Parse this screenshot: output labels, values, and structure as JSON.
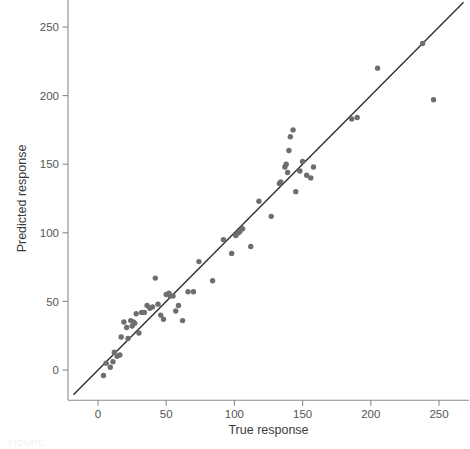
{
  "figure": {
    "caption_fragment": "FIGURE",
    "background_color": "#ffffff"
  },
  "chart_data": {
    "type": "scatter",
    "title": "",
    "xlabel": "True response",
    "ylabel": "Predicted response",
    "xlim": [
      -22,
      272
    ],
    "ylim": [
      -22,
      272
    ],
    "xticks": [
      0,
      50,
      100,
      150,
      200,
      250
    ],
    "yticks": [
      0,
      50,
      100,
      150,
      200,
      250
    ],
    "xtick_labels": [
      "0",
      "50",
      "100",
      "150",
      "200",
      "250"
    ],
    "ytick_labels": [
      "0",
      "50",
      "100",
      "150",
      "200",
      "250"
    ],
    "grid": false,
    "legend": "none",
    "point_color": "#6e6e6e",
    "point_size": 5,
    "reference_line": {
      "label": "y = x identity line",
      "color": "#2b2b2b",
      "x": [
        -18,
        268
      ],
      "y": [
        -18,
        268
      ]
    },
    "points": [
      {
        "x": 4,
        "y": -4
      },
      {
        "x": 6,
        "y": 5
      },
      {
        "x": 9,
        "y": 2
      },
      {
        "x": 11,
        "y": 6
      },
      {
        "x": 12,
        "y": 13
      },
      {
        "x": 14,
        "y": 10
      },
      {
        "x": 16,
        "y": 11
      },
      {
        "x": 17,
        "y": 24
      },
      {
        "x": 19,
        "y": 35
      },
      {
        "x": 21,
        "y": 31
      },
      {
        "x": 22,
        "y": 23
      },
      {
        "x": 24,
        "y": 36
      },
      {
        "x": 25,
        "y": 32
      },
      {
        "x": 26,
        "y": 35
      },
      {
        "x": 27,
        "y": 34
      },
      {
        "x": 28,
        "y": 41
      },
      {
        "x": 30,
        "y": 27
      },
      {
        "x": 32,
        "y": 42
      },
      {
        "x": 34,
        "y": 42
      },
      {
        "x": 36,
        "y": 47
      },
      {
        "x": 38,
        "y": 45
      },
      {
        "x": 40,
        "y": 46
      },
      {
        "x": 42,
        "y": 67
      },
      {
        "x": 44,
        "y": 48
      },
      {
        "x": 46,
        "y": 40
      },
      {
        "x": 48,
        "y": 37
      },
      {
        "x": 50,
        "y": 55
      },
      {
        "x": 52,
        "y": 56
      },
      {
        "x": 53,
        "y": 54
      },
      {
        "x": 55,
        "y": 54
      },
      {
        "x": 57,
        "y": 43
      },
      {
        "x": 59,
        "y": 47
      },
      {
        "x": 62,
        "y": 36
      },
      {
        "x": 66,
        "y": 57
      },
      {
        "x": 70,
        "y": 57
      },
      {
        "x": 74,
        "y": 79
      },
      {
        "x": 84,
        "y": 65
      },
      {
        "x": 92,
        "y": 95
      },
      {
        "x": 98,
        "y": 85
      },
      {
        "x": 101,
        "y": 98
      },
      {
        "x": 103,
        "y": 100
      },
      {
        "x": 104,
        "y": 101
      },
      {
        "x": 106,
        "y": 103
      },
      {
        "x": 112,
        "y": 90
      },
      {
        "x": 118,
        "y": 123
      },
      {
        "x": 127,
        "y": 112
      },
      {
        "x": 133,
        "y": 136
      },
      {
        "x": 134,
        "y": 137
      },
      {
        "x": 137,
        "y": 148
      },
      {
        "x": 138,
        "y": 150
      },
      {
        "x": 139,
        "y": 144
      },
      {
        "x": 140,
        "y": 160
      },
      {
        "x": 141,
        "y": 170
      },
      {
        "x": 143,
        "y": 175
      },
      {
        "x": 145,
        "y": 130
      },
      {
        "x": 148,
        "y": 145
      },
      {
        "x": 150,
        "y": 152
      },
      {
        "x": 153,
        "y": 142
      },
      {
        "x": 156,
        "y": 140
      },
      {
        "x": 158,
        "y": 148
      },
      {
        "x": 186,
        "y": 183
      },
      {
        "x": 190,
        "y": 184
      },
      {
        "x": 205,
        "y": 220
      },
      {
        "x": 238,
        "y": 238
      },
      {
        "x": 246,
        "y": 197
      }
    ]
  }
}
